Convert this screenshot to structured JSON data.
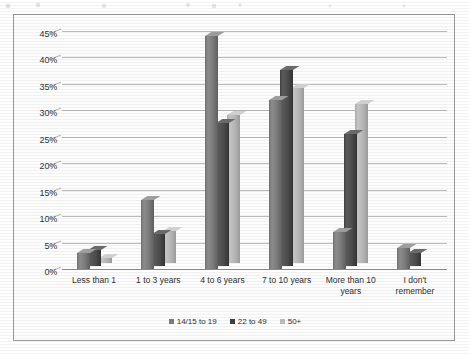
{
  "chart_data": {
    "type": "bar",
    "title": "",
    "subtitle": "",
    "xlabel": "",
    "ylabel": "",
    "ylim": [
      0,
      45
    ],
    "ytick_step": 5,
    "grid": true,
    "legend_position": "bottom",
    "style": "3d-clustered-column-grayscale",
    "categories": [
      "Less than 1",
      "1 to 3 years",
      "4 to 6 years",
      "7 to 10 years",
      "More than 10 years",
      "I don't remember"
    ],
    "ytick_labels": [
      "0%",
      "5%",
      "10%",
      "15%",
      "20%",
      "25%",
      "30%",
      "35%",
      "40%",
      "45%"
    ],
    "series": [
      {
        "name": "14/15 to 19",
        "color": "#7d7d7d",
        "values": [
          3,
          13,
          44,
          32,
          7,
          4
        ]
      },
      {
        "name": "22 to 49",
        "color": "#3f3f3f",
        "values": [
          3,
          6,
          27,
          37,
          25,
          2.5
        ]
      },
      {
        "name": "50+",
        "color": "#bdbdbd",
        "values": [
          1,
          6,
          28,
          33,
          30,
          0
        ]
      }
    ]
  },
  "legend": {
    "items": [
      {
        "label": "14/15 to 19"
      },
      {
        "label": "22 to 49"
      },
      {
        "label": "50+"
      }
    ]
  }
}
